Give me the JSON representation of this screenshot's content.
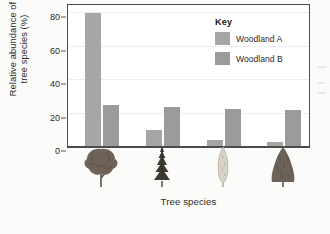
{
  "chart_data": {
    "type": "bar",
    "title": "",
    "xlabel": "Tree species",
    "ylabel": "Relative abundance of tree species (%)",
    "ylabel_line1": "Relative abundance of",
    "ylabel_line2": "tree species (%)",
    "categories": [
      "Broadleaf tree",
      "Conifer spruce",
      "Columnar poplar",
      "Conical fir"
    ],
    "series": [
      {
        "name": "Woodland A",
        "values": [
          80,
          10,
          4,
          3
        ],
        "color": "#a6a6a6"
      },
      {
        "name": "Woodland B",
        "values": [
          25,
          24,
          23,
          22
        ],
        "color": "#9b9b9b"
      }
    ],
    "yticks": [
      0,
      20,
      40,
      60,
      80
    ],
    "ylim": [
      0,
      85
    ],
    "grid": true,
    "legend_position": "top-right"
  },
  "legend": {
    "title": "Key",
    "entries": [
      {
        "label": "Woodland A"
      },
      {
        "label": "Woodland B"
      }
    ]
  },
  "axes": {
    "y_title_line1": "Relative abundance of",
    "y_title_line2": "tree species (%)",
    "x_title": "Tree species",
    "tick_0": "0",
    "tick_20": "20",
    "tick_40": "40",
    "tick_60": "60",
    "tick_80": "80"
  },
  "icons": [
    {
      "name": "broadleaf-tree-icon"
    },
    {
      "name": "spruce-conifer-tree-icon"
    },
    {
      "name": "columnar-poplar-tree-icon"
    },
    {
      "name": "conical-fir-tree-icon"
    }
  ],
  "colors": {
    "series_a": "#a6a6a6",
    "series_b": "#9b9b9b",
    "axis": "#4c4c4c",
    "text": "#2b2b2b",
    "grid": "#eeeeee"
  }
}
